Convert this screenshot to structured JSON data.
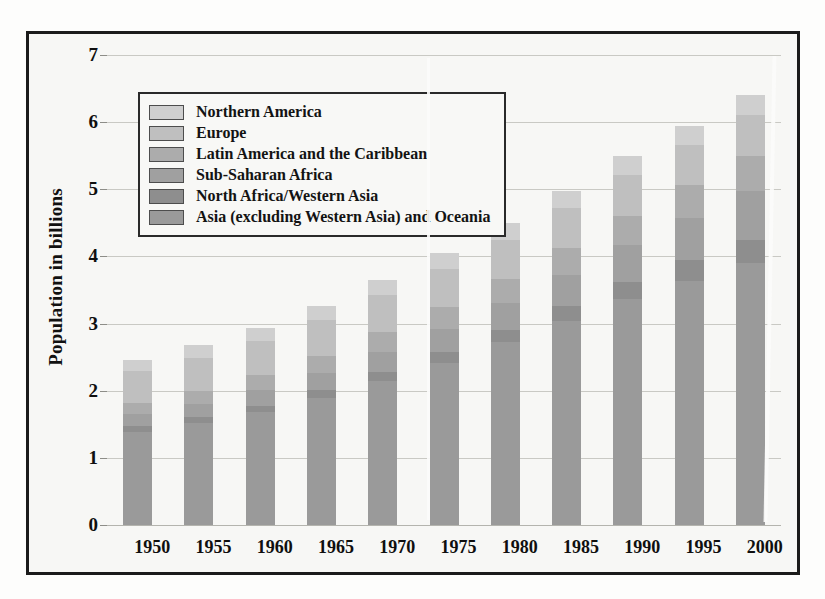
{
  "chart_data": {
    "type": "bar",
    "stacked": true,
    "title": "",
    "xlabel": "",
    "ylabel": "Population in billions",
    "ylim": [
      0,
      7
    ],
    "ytick_labels": [
      "0",
      "1",
      "2",
      "3",
      "4",
      "5",
      "6",
      "7"
    ],
    "ytick_values": [
      0,
      1,
      2,
      3,
      4,
      5,
      6,
      7
    ],
    "grid": true,
    "legend_position": "top-left-inside",
    "categories": [
      "1950",
      "1955",
      "1960",
      "1965",
      "1970",
      "1975",
      "1980",
      "1985",
      "1990",
      "1995",
      "2000"
    ],
    "series": [
      {
        "name": "Asia (excluding Western Asia) and Oceania",
        "color": "#9a9a9a",
        "values": [
          1.39,
          1.52,
          1.68,
          1.89,
          2.14,
          2.42,
          2.72,
          3.04,
          3.36,
          3.64,
          3.9
        ]
      },
      {
        "name": "North Africa/Western Asia",
        "color": "#8e8e8e",
        "values": [
          0.08,
          0.09,
          0.1,
          0.12,
          0.14,
          0.16,
          0.19,
          0.22,
          0.26,
          0.3,
          0.34
        ]
      },
      {
        "name": "Sub-Saharan Africa",
        "color": "#a0a0a0",
        "values": [
          0.18,
          0.2,
          0.23,
          0.26,
          0.3,
          0.34,
          0.4,
          0.47,
          0.55,
          0.64,
          0.74
        ]
      },
      {
        "name": "Latin America and the Caribbean",
        "color": "#acacac",
        "values": [
          0.17,
          0.19,
          0.22,
          0.25,
          0.29,
          0.32,
          0.36,
          0.4,
          0.44,
          0.48,
          0.52
        ]
      },
      {
        "name": "Europe",
        "color": "#bfbfbf",
        "values": [
          0.47,
          0.49,
          0.51,
          0.53,
          0.55,
          0.57,
          0.58,
          0.59,
          0.6,
          0.6,
          0.6
        ]
      },
      {
        "name": "Northern America",
        "color": "#cfcfcf",
        "values": [
          0.17,
          0.19,
          0.2,
          0.21,
          0.23,
          0.24,
          0.25,
          0.26,
          0.28,
          0.29,
          0.31
        ]
      }
    ],
    "totals": [
      2.46,
      2.68,
      2.94,
      3.26,
      3.65,
      4.05,
      4.5,
      4.98,
      5.49,
      5.95,
      6.41
    ]
  },
  "legend": {
    "items": [
      {
        "label": "Northern America",
        "color": "#cfcfcf"
      },
      {
        "label": "Europe",
        "color": "#bfbfbf"
      },
      {
        "label": "Latin America and the Caribbean",
        "color": "#acacac"
      },
      {
        "label": "Sub-Saharan Africa",
        "color": "#a0a0a0"
      },
      {
        "label": "North Africa/Western Asia",
        "color": "#8e8e8e"
      },
      {
        "label": "Asia (excluding Western Asia) and Oceania",
        "color": "#9a9a9a"
      }
    ]
  }
}
